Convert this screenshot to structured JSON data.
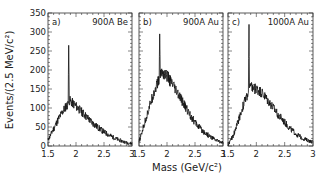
{
  "chart_data": [
    {
      "type": "line",
      "panel_label": "a)",
      "title": "900A Be",
      "xlabel": "Mass (GeV/c²)",
      "ylabel": "Events/(2.5 MeV/c²)",
      "xlim": [
        1.5,
        3.0
      ],
      "ylim": [
        0,
        350
      ],
      "x": [
        1.5,
        1.6,
        1.7,
        1.8,
        1.86,
        1.87,
        1.88,
        1.9,
        2.0,
        2.1,
        2.2,
        2.3,
        2.4,
        2.5,
        2.6,
        2.7,
        2.8,
        2.9,
        3.0
      ],
      "values": [
        15,
        45,
        75,
        100,
        110,
        265,
        120,
        118,
        105,
        90,
        75,
        60,
        48,
        37,
        28,
        20,
        14,
        9,
        6
      ]
    },
    {
      "type": "line",
      "panel_label": "b)",
      "title": "900A Au",
      "xlabel": "Mass (GeV/c²)",
      "ylim": [
        0,
        350
      ],
      "xlim": [
        1.5,
        3.0
      ],
      "x": [
        1.5,
        1.6,
        1.7,
        1.8,
        1.86,
        1.87,
        1.88,
        1.9,
        2.0,
        2.1,
        2.2,
        2.3,
        2.4,
        2.5,
        2.6,
        2.7,
        2.8,
        2.9,
        3.0
      ],
      "values": [
        10,
        60,
        110,
        155,
        175,
        295,
        185,
        195,
        185,
        160,
        135,
        110,
        85,
        62,
        45,
        32,
        22,
        14,
        9
      ]
    },
    {
      "type": "line",
      "panel_label": "c)",
      "title": "1000A Au",
      "xlabel": "Mass (GeV/c²)",
      "ylim": [
        0,
        350
      ],
      "xlim": [
        1.5,
        3.0
      ],
      "x": [
        1.5,
        1.6,
        1.7,
        1.8,
        1.86,
        1.87,
        1.88,
        1.9,
        2.0,
        2.1,
        2.2,
        2.3,
        2.4,
        2.5,
        2.6,
        2.7,
        2.8,
        2.9,
        3.0
      ],
      "values": [
        2,
        30,
        75,
        120,
        140,
        320,
        150,
        155,
        150,
        140,
        120,
        100,
        80,
        62,
        45,
        32,
        22,
        15,
        10
      ]
    }
  ],
  "axes": {
    "ylabel": "Events/(2.5 MeV/c²)",
    "xlabel": "Mass   (GeV/c²)",
    "yticks": [
      "0",
      "50",
      "100",
      "150",
      "200",
      "250",
      "300",
      "350"
    ],
    "xticks": [
      "1.5",
      "2",
      "2.5",
      "3"
    ]
  },
  "panels": [
    {
      "label": "a)",
      "title": "900A Be"
    },
    {
      "label": "b)",
      "title": "900A Au"
    },
    {
      "label": "c)",
      "title": "1000A Au"
    }
  ]
}
